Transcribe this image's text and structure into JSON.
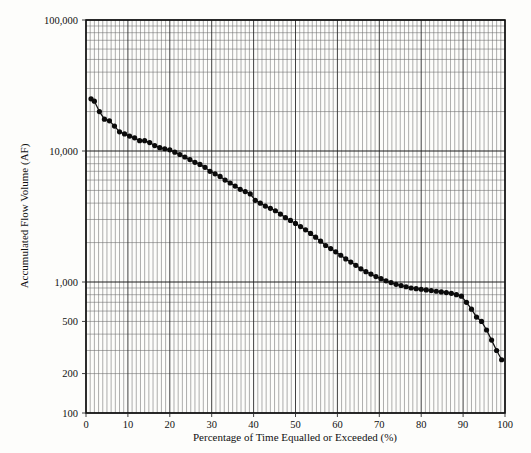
{
  "chart_data": {
    "type": "line",
    "title": "",
    "subtitle": "",
    "xlabel": "Percentage of Time Equalled or Exceeded (%)",
    "ylabel": "Accumulated Flow Volume (AF)",
    "xlim": [
      0,
      100
    ],
    "ylim": [
      100,
      100000
    ],
    "yscale": "log",
    "xscale": "linear",
    "grid": true,
    "grid_style": "log-log-paper (major decade lines plus logarithmic minor lines on y; 1% minor lines on x)",
    "legend": null,
    "legend_position": "none",
    "x_ticks": [
      0,
      10,
      20,
      30,
      40,
      50,
      60,
      70,
      80,
      90,
      100
    ],
    "x_tick_labels": [
      "0",
      "10",
      "20",
      "30",
      "40",
      "50",
      "60",
      "70",
      "80",
      "90",
      "100"
    ],
    "y_ticks": [
      100,
      200,
      500,
      1000,
      10000,
      100000
    ],
    "y_tick_labels": [
      "100",
      "200",
      "500",
      "1,000",
      "10,000",
      "100,000"
    ],
    "marker": "filled-circle",
    "line_color": "#101010",
    "marker_color": "#0b0b0b",
    "series": [
      {
        "name": "Accumulated Flow Volume Duration Curve",
        "x": [
          1.2,
          2.0,
          3.2,
          4.4,
          5.6,
          6.8,
          8.0,
          9.2,
          10.4,
          11.6,
          12.8,
          14.0,
          15.2,
          16.4,
          17.6,
          18.8,
          20.0,
          21.2,
          22.4,
          23.6,
          24.8,
          26.0,
          27.2,
          28.4,
          29.6,
          30.8,
          32.0,
          33.2,
          34.4,
          35.6,
          36.8,
          38.0,
          39.2,
          40.4,
          41.6,
          42.8,
          44.0,
          45.2,
          46.4,
          47.6,
          48.8,
          50.0,
          51.2,
          52.4,
          53.6,
          54.8,
          56.0,
          57.2,
          58.4,
          59.6,
          60.8,
          62.0,
          63.2,
          64.4,
          65.6,
          66.8,
          68.0,
          69.2,
          70.4,
          71.6,
          72.8,
          74.0,
          75.2,
          76.4,
          77.6,
          78.8,
          80.0,
          81.2,
          82.4,
          83.6,
          84.8,
          86.0,
          87.2,
          88.4,
          89.6,
          90.8,
          92.0,
          93.2,
          94.4,
          95.6,
          96.8,
          98.0,
          99.2
        ],
        "y": [
          25000,
          24000,
          20000,
          17500,
          17000,
          15500,
          14000,
          13500,
          13000,
          12600,
          12000,
          12000,
          11600,
          11000,
          10600,
          10400,
          10200,
          9800,
          9400,
          9000,
          8600,
          8200,
          7900,
          7500,
          7000,
          6700,
          6400,
          6000,
          5700,
          5400,
          5100,
          4900,
          4700,
          4200,
          4000,
          3800,
          3650,
          3500,
          3300,
          3100,
          2950,
          2800,
          2650,
          2500,
          2350,
          2200,
          2050,
          1900,
          1800,
          1700,
          1600,
          1500,
          1420,
          1340,
          1260,
          1200,
          1150,
          1100,
          1060,
          1020,
          990,
          960,
          940,
          920,
          900,
          890,
          880,
          870,
          860,
          850,
          840,
          830,
          820,
          800,
          780,
          700,
          620,
          540,
          500,
          430,
          360,
          300,
          255
        ]
      }
    ]
  },
  "axes": {
    "y_title": "Accumulated Flow Volume (AF)",
    "x_title": "Percentage of Time Equalled or Exceeded (%)",
    "y_labels": [
      "100,000",
      "10,000",
      "1,000",
      "500",
      "200",
      "100"
    ],
    "x_labels": [
      "0",
      "10",
      "20",
      "30",
      "40",
      "50",
      "60",
      "70",
      "80",
      "90",
      "100"
    ]
  },
  "colors": {
    "background": "#fdfdfb",
    "frame": "#111111",
    "grid_minor": "#6b6b6b",
    "grid_major": "#2b2b2b",
    "series": "#101010"
  }
}
